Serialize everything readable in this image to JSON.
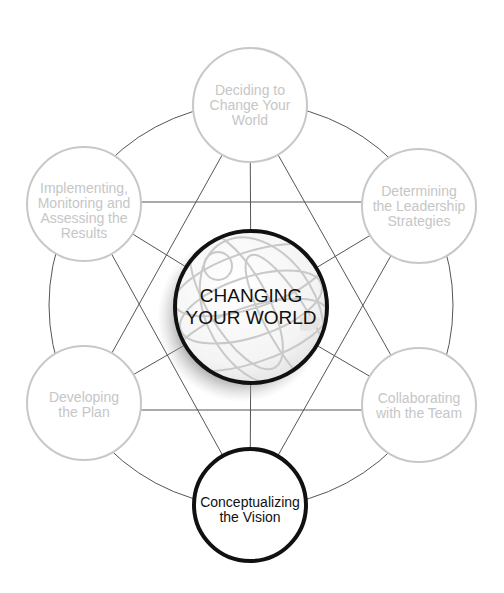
{
  "colors": {
    "background": "#ffffff",
    "inactive_stroke": "#c8c8c8",
    "inactive_text": "#c6c6c6",
    "active_stroke": "#111111",
    "connector": "#555555"
  },
  "center": {
    "line1": "CHANGING",
    "line2": "YOUR WORLD",
    "icon": "globe-icon"
  },
  "nodes": [
    {
      "id": "deciding",
      "lines": [
        "Deciding to",
        "Change Your",
        "World"
      ],
      "active": false
    },
    {
      "id": "determining",
      "lines": [
        "Determining",
        "the Leadership",
        "Strategies"
      ],
      "active": false
    },
    {
      "id": "collaborating",
      "lines": [
        "Collaborating",
        "with the Team"
      ],
      "active": false
    },
    {
      "id": "conceptualizing",
      "lines": [
        "Conceptualizing",
        "the Vision"
      ],
      "active": true
    },
    {
      "id": "developing",
      "lines": [
        "Developing",
        "the Plan"
      ],
      "active": false
    },
    {
      "id": "implementing",
      "lines": [
        "Implementing,",
        "Monitoring and",
        "Assessing the",
        "Results"
      ],
      "active": false
    }
  ]
}
